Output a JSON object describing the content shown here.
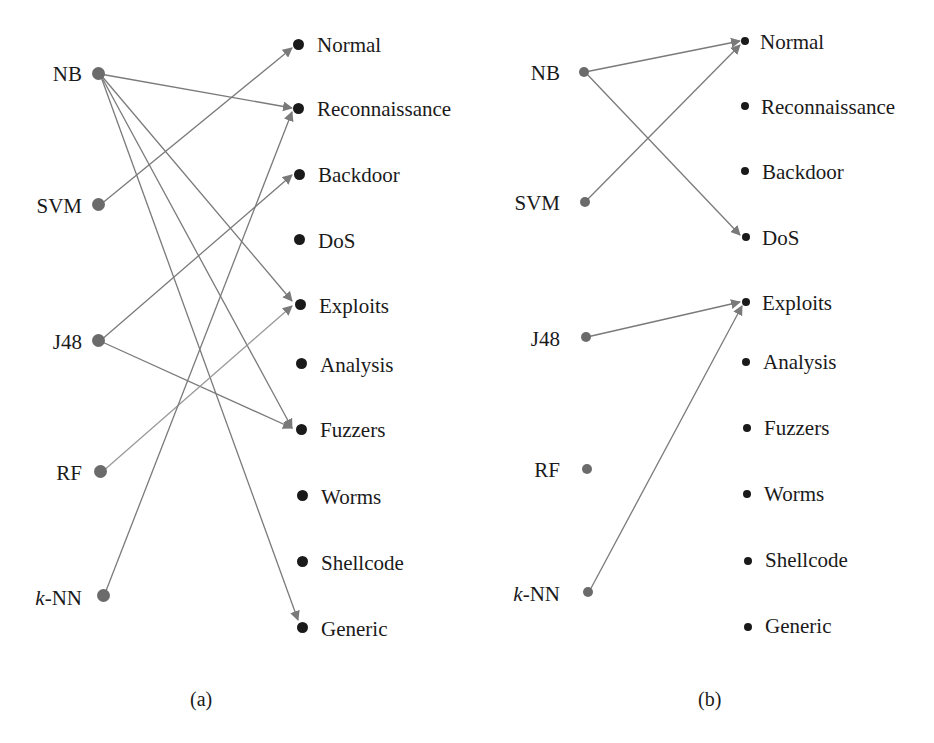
{
  "figure": {
    "panels": [
      {
        "caption": "(a)",
        "sources": [
          "NB",
          "SVM",
          "J48",
          "RF",
          "k-NN"
        ],
        "targets": [
          "Normal",
          "Reconnaissance",
          "Backdoor",
          "DoS",
          "Exploits",
          "Analysis",
          "Fuzzers",
          "Worms",
          "Shellcode",
          "Generic"
        ],
        "edges": [
          {
            "from": "NB",
            "to": "Reconnaissance"
          },
          {
            "from": "NB",
            "to": "Exploits"
          },
          {
            "from": "NB",
            "to": "Fuzzers"
          },
          {
            "from": "NB",
            "to": "Generic"
          },
          {
            "from": "SVM",
            "to": "Normal"
          },
          {
            "from": "J48",
            "to": "Backdoor"
          },
          {
            "from": "J48",
            "to": "Fuzzers"
          },
          {
            "from": "RF",
            "to": "Exploits"
          },
          {
            "from": "k-NN",
            "to": "Reconnaissance"
          }
        ]
      },
      {
        "caption": "(b)",
        "sources": [
          "NB",
          "SVM",
          "J48",
          "RF",
          "k-NN"
        ],
        "targets": [
          "Normal",
          "Reconnaissance",
          "Backdoor",
          "DoS",
          "Exploits",
          "Analysis",
          "Fuzzers",
          "Worms",
          "Shellcode",
          "Generic"
        ],
        "edges": [
          {
            "from": "NB",
            "to": "Normal"
          },
          {
            "from": "NB",
            "to": "DoS"
          },
          {
            "from": "SVM",
            "to": "Normal"
          },
          {
            "from": "J48",
            "to": "Exploits"
          },
          {
            "from": "k-NN",
            "to": "Exploits"
          }
        ]
      }
    ],
    "colors": {
      "source_node": "#6b6b6b",
      "target_node": "#1a1a1a",
      "edge": "#7a7a7a"
    }
  }
}
